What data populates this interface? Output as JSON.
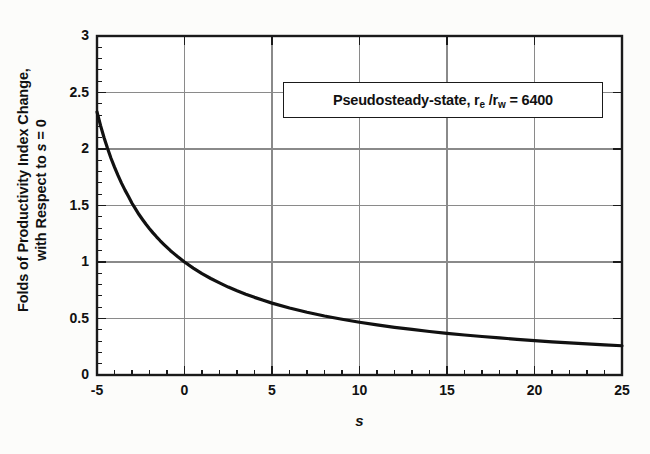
{
  "chart_data": {
    "type": "line",
    "title": "",
    "xlabel": "s",
    "ylabel": "Folds of Productivity Index Change, with Respect to s = 0",
    "ylabel_line1": "Folds of Productivity Index Change,",
    "ylabel_line2_pre": "with Respect to ",
    "ylabel_line2_ital": "s",
    "ylabel_line2_post": " = 0",
    "xlim": [
      -5,
      25
    ],
    "ylim": [
      0,
      3
    ],
    "xticks": [
      -5,
      0,
      5,
      10,
      15,
      20,
      25
    ],
    "yticks": [
      0,
      0.5,
      1,
      1.5,
      2,
      2.5,
      3
    ],
    "xtick_labels": [
      "-5",
      "0",
      "5",
      "10",
      "15",
      "20",
      "25"
    ],
    "ytick_labels": [
      "0",
      "0.5",
      "1",
      "1.5",
      "2",
      "2.5",
      "3"
    ],
    "x_minor_step": 1,
    "y_minor_step": 0.1,
    "grid": true,
    "grid_color": "#8a8a8a",
    "legend_position": "none",
    "line_color": "#111111",
    "line_width": 3.2,
    "annotation": {
      "text": "Pseudosteady-state, r_e /r_w = 6400",
      "text_pre": "Pseudosteady-state, r",
      "text_sub1": "e",
      "text_mid": " /r",
      "text_sub2": "w",
      "text_post": " = 6400",
      "boxed": true
    },
    "equation": "J/J0 = ln(re/rw) / (ln(re/rw) + s)",
    "ln_re_rw": 8.7643,
    "series": [
      {
        "name": "Folds of Productivity Index Change",
        "x": [
          -5,
          -4.8,
          -4.6,
          -4.4,
          -4.2,
          -4,
          -3.8,
          -3.6,
          -3.4,
          -3.2,
          -3,
          -2.8,
          -2.6,
          -2.4,
          -2.2,
          -2,
          -1.8,
          -1.6,
          -1.4,
          -1.2,
          -1,
          -0.8,
          -0.6,
          -0.4,
          -0.2,
          0,
          0.5,
          1,
          1.5,
          2,
          2.5,
          3,
          3.5,
          4,
          4.5,
          5,
          6,
          7,
          8,
          9,
          10,
          11,
          12,
          13,
          14,
          15,
          16,
          17,
          18,
          19,
          20,
          21,
          22,
          23,
          24,
          25
        ],
        "y": [
          2.328,
          2.209,
          2.102,
          2.006,
          1.918,
          1.839,
          1.766,
          1.698,
          1.636,
          1.579,
          1.52,
          1.47,
          1.42,
          1.376,
          1.334,
          1.295,
          1.258,
          1.223,
          1.19,
          1.159,
          1.129,
          1.1,
          1.074,
          1.048,
          1.024,
          1.0,
          0.946,
          0.897,
          0.854,
          0.815,
          0.778,
          0.745,
          0.715,
          0.687,
          0.661,
          0.636,
          0.593,
          0.555,
          0.522,
          0.493,
          0.467,
          0.443,
          0.422,
          0.403,
          0.385,
          0.369,
          0.354,
          0.341,
          0.328,
          0.316,
          0.305,
          0.294,
          0.285,
          0.276,
          0.267,
          0.259
        ]
      }
    ]
  }
}
